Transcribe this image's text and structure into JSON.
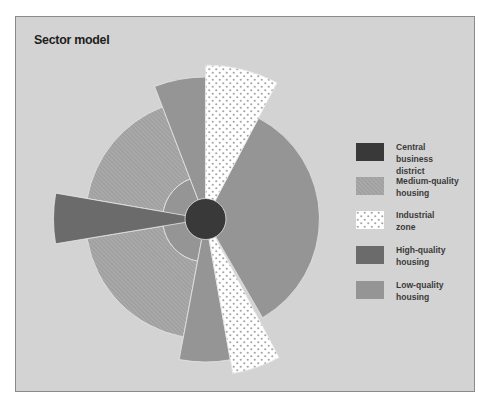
{
  "title": "Sector model",
  "center": {
    "x": 204.5,
    "y": 218
  },
  "colors": {
    "background": "#d3d3d3",
    "frame_border": "#8a8a8a",
    "cbd": "#393939",
    "medium": "#a9a9a9",
    "medium_hatch": "#8f8f8f",
    "industrial": "#ffffff",
    "industrial_dot": "#a6a6a6",
    "high": "#6b6b6b",
    "low": "#959595",
    "separator": "#e6e6e6"
  },
  "legend": {
    "items": [
      {
        "key": "cbd",
        "line1": "Central business",
        "line2": "district"
      },
      {
        "key": "medium",
        "line1": "Medium-quality",
        "line2": "housing"
      },
      {
        "key": "industrial",
        "line1": "Industrial",
        "line2": "zone"
      },
      {
        "key": "high",
        "line1": "High-quality",
        "line2": "housing"
      },
      {
        "key": "low",
        "line1": "Low-quality",
        "line2": "housing"
      }
    ]
  },
  "sectors": [
    {
      "zone": "low",
      "start": 100.6,
      "end": 249,
      "r_inner": 0,
      "r_outer": 43
    },
    {
      "zone": "medium",
      "start": 100.6,
      "end": 170.6,
      "r_inner": 43,
      "r_outer": 120
    },
    {
      "zone": "medium",
      "start": 189.8,
      "end": 249,
      "r_inner": 43,
      "r_outer": 120
    },
    {
      "zone": "low",
      "start": 249,
      "end": 270,
      "r_inner": 0,
      "r_outer": 142
    },
    {
      "zone": "low",
      "start": 297.7,
      "end": 420,
      "r_inner": 0,
      "r_outer": 114
    },
    {
      "zone": "low",
      "start": 80,
      "end": 100.6,
      "r_inner": 0,
      "r_outer": 143
    },
    {
      "zone": "industrial",
      "start": 270,
      "end": 297.7,
      "r_inner": 0,
      "r_outer": 154
    },
    {
      "zone": "industrial",
      "start": 62,
      "end": 80,
      "r_inner": 0,
      "r_outer": 157
    },
    {
      "zone": "high",
      "start": 170.6,
      "end": 189.8,
      "r_inner": 0,
      "r_outer": 152
    }
  ],
  "cbd": {
    "radius": 20.5
  }
}
